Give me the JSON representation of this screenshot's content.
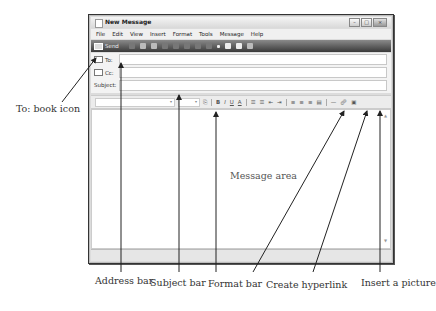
{
  "window": {
    "title": "New Message",
    "controls": [
      "minimize",
      "maximize",
      "close"
    ]
  },
  "menu": {
    "items": [
      "File",
      "Edit",
      "View",
      "Insert",
      "Format",
      "Tools",
      "Message",
      "Help"
    ]
  },
  "toolbar": {
    "send_label": "Send"
  },
  "header": {
    "to_label": "To:",
    "cc_label": "Cc:",
    "subject_label": "Subject:",
    "to_value": "",
    "cc_value": "",
    "subject_value": ""
  },
  "formatbar": {
    "font_name": "",
    "font_size": "",
    "buttons": [
      "B",
      "I",
      "U",
      "A",
      "1=",
      "•=",
      "<=",
      "=>",
      "≡",
      "≡",
      "≡",
      "≡",
      "—",
      "link",
      "img"
    ]
  },
  "message": {
    "body": ""
  },
  "annotations": {
    "book_icon": "To: book icon",
    "message_area": "Message area",
    "address_bar": "Address bar",
    "subject_bar": "Subject bar",
    "format_bar": "Format bar",
    "create_hyperlink": "Create hyperlink",
    "insert_picture": "Insert a picture"
  }
}
